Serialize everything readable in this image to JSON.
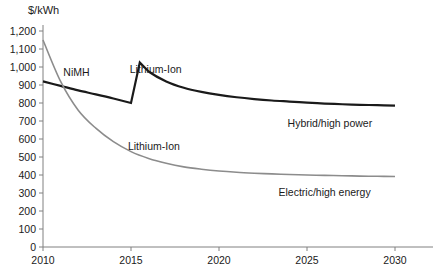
{
  "chart_data": {
    "type": "line",
    "title": "",
    "xlabel": "",
    "ylabel": "$/kWh",
    "xlim": [
      2010,
      2030
    ],
    "ylim": [
      0,
      1200
    ],
    "grid": false,
    "legend_position": "inline-annotations",
    "xticks": [
      2010,
      2015,
      2020,
      2025,
      2030
    ],
    "xtick_labels": [
      "2010",
      "2015",
      "2020",
      "2025",
      "2030"
    ],
    "yticks": [
      0,
      100,
      200,
      300,
      400,
      500,
      600,
      700,
      800,
      900,
      1000,
      1100,
      1200
    ],
    "ytick_labels": [
      "0",
      "100",
      "200",
      "300",
      "400",
      "500",
      "600",
      "700",
      "800",
      "900",
      "1,000",
      "1,100",
      "1,200"
    ],
    "series": [
      {
        "name": "Hybrid/high power",
        "color": "#1a1a1a",
        "width": 2.2,
        "end_label": "Hybrid/high power",
        "inline_labels": [
          "NiMH",
          "Lithium-Ion"
        ],
        "x": [
          2010,
          2011,
          2012,
          2013,
          2014,
          2015,
          2015.5,
          2016,
          2017,
          2018,
          2019,
          2020,
          2021,
          2022,
          2023,
          2024,
          2025,
          2026,
          2027,
          2028,
          2029,
          2030
        ],
        "values": [
          920,
          895,
          870,
          848,
          825,
          800,
          1025,
          975,
          920,
          885,
          862,
          845,
          832,
          822,
          814,
          808,
          802,
          797,
          793,
          790,
          788,
          785
        ]
      },
      {
        "name": "Electric/high energy",
        "color": "#8c8c8c",
        "width": 1.6,
        "end_label": "Electric/high energy",
        "inline_labels": [
          "Lithium-Ion"
        ],
        "x": [
          2010,
          2011,
          2012,
          2013,
          2014,
          2015,
          2016,
          2017,
          2018,
          2019,
          2020,
          2021,
          2022,
          2023,
          2024,
          2025,
          2026,
          2027,
          2028,
          2029,
          2030
        ],
        "values": [
          1150,
          920,
          760,
          660,
          585,
          530,
          492,
          465,
          445,
          432,
          422,
          415,
          410,
          406,
          403,
          400,
          398,
          396,
          394,
          393,
          392
        ]
      }
    ],
    "annotations": [
      {
        "text": "NiMH",
        "x": 2011.9,
        "y": 975,
        "series": "Hybrid/high power"
      },
      {
        "text": "Lithium-Ion",
        "x": 2016.4,
        "y": 990,
        "series": "Hybrid/high power"
      },
      {
        "text": "Lithium-Ion",
        "x": 2016.3,
        "y": 560,
        "series": "Electric/high energy"
      },
      {
        "text": "Hybrid/high power",
        "x": 2026.3,
        "y": 690,
        "series": "Hybrid/high power"
      },
      {
        "text": "Electric/high energy",
        "x": 2026.0,
        "y": 305,
        "series": "Electric/high energy"
      }
    ],
    "axis_color": "#808080"
  }
}
